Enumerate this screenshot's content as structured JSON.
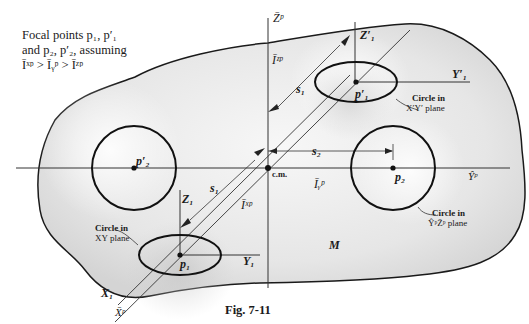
{
  "note": {
    "line1": "Focal points p₁, p′₁",
    "line2": "and p₂, p′₂, assuming",
    "line3": "Īˣᵖ > Īᵧᵖ > Īᶻᵖ"
  },
  "axes": {
    "z_bar_p": "Z̄ᵖ",
    "y_bar_p": "Ŷᵖ",
    "x_bar_p": "X̄ᵖ",
    "Z1": "Z₁",
    "Z1_prime": "Z′₁",
    "Y1": "Y₁",
    "Y1_prime": "Y′₁",
    "X1": "X₁"
  },
  "moments": {
    "Iz": "Īᶻᵖ",
    "Iy": "Īᵧᵖ",
    "Ix": "Īˣᵖ"
  },
  "distances": {
    "s1_upper": "s₁",
    "s1_lower": "s₁",
    "s2": "s₂"
  },
  "points": {
    "cm": "c.m.",
    "p1": "p₁",
    "p1_prime": "p′₁",
    "p2": "p₂",
    "p2_prime": "p′₂"
  },
  "circle_labels": {
    "xy_line1": "Circle in",
    "xy_line2": "XY plane",
    "xpyp_line1": "Circle in",
    "xpyp_line2": "X′Y′ plane",
    "yz_line1": "Circle in",
    "yz_line2": "ŶᵖZ̄ᵖ plane"
  },
  "body_label": "M",
  "caption": "Fig. 7-11"
}
